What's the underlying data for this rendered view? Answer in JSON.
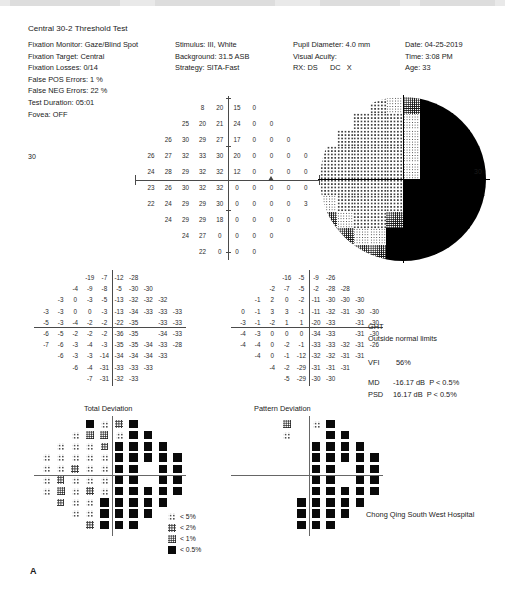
{
  "report": {
    "title": "Central 30-2 Threshold Test",
    "footer_mark": "A",
    "hospital": "Chong Qing South West Hospital"
  },
  "header": {
    "col1": [
      {
        "label": "Fixation Monitor:",
        "value": "Gaze/Blind Spot"
      },
      {
        "label": "Fixation Target:",
        "value": "Central"
      },
      {
        "label": "Fixation Losses:",
        "value": "0/14"
      },
      {
        "label": "False POS Errors:",
        "value": "1 %"
      },
      {
        "label": "False NEG Errors:",
        "value": "22 %"
      },
      {
        "label": "Test Duration:",
        "value": "05:01"
      },
      {
        "label": "Fovea:",
        "value": "OFF"
      }
    ],
    "col2": [
      {
        "label": "Stimulus:",
        "value": "III, White"
      },
      {
        "label": "Background:",
        "value": "31.5 ASB"
      },
      {
        "label": "Strategy:",
        "value": "SITA-Fast"
      }
    ],
    "col3": [
      {
        "label": "Pupil Diameter:",
        "value": "4.0 mm"
      },
      {
        "label": "Visual Acuity:",
        "value": ""
      },
      {
        "label": "RX:",
        "value": "DS      DC   X"
      }
    ],
    "col4": [
      {
        "label": "Date:",
        "value": "04-25-2019"
      },
      {
        "label": "Time:",
        "value": "3:08 PM"
      },
      {
        "label": "Age:",
        "value": "33"
      }
    ]
  },
  "indices": {
    "ght_label": "GHT",
    "ght_value": "Outside normal limits",
    "vfi_label": "VFI",
    "vfi_value": "56%",
    "md_label": "MD",
    "md_value": "-16.17 dB  P < 0.5%",
    "psd_label": "PSD",
    "psd_value": "16.17 dB  P < 0.5%"
  },
  "sections": {
    "total_deviation": "Total Deviation",
    "pattern_deviation": "Pattern Deviation",
    "axis_label_30": "30"
  },
  "legend": {
    "items": [
      {
        "sym": "s-5",
        "label": "< 5%"
      },
      {
        "sym": "s-2",
        "label": "< 2%"
      },
      {
        "sym": "s-1",
        "label": "< 1%"
      },
      {
        "sym": "s-05",
        "label": "< 0.5%"
      }
    ]
  },
  "chart_data": {
    "type": "heatmap",
    "xlabel": "",
    "ylabel": "",
    "units": "dB",
    "grid_pattern": "30-2 (76 test locations, 6° spacing)",
    "threshold_values": {
      "name": "Threshold (dB) sensitivity grid",
      "rows": [
        {
          "cols": [
            null,
            null,
            null,
            "8",
            "20",
            "15",
            "0",
            null,
            null,
            null
          ]
        },
        {
          "cols": [
            null,
            null,
            "25",
            "20",
            "21",
            "24",
            "0",
            "0",
            null,
            null
          ]
        },
        {
          "cols": [
            null,
            "26",
            "30",
            "29",
            "27",
            "17",
            "0",
            "0",
            "0",
            null
          ]
        },
        {
          "cols": [
            "26",
            "27",
            "32",
            "33",
            "30",
            "20",
            "0",
            "0",
            "0",
            "0"
          ]
        },
        {
          "cols": [
            "24",
            "28",
            "29",
            "32",
            "32",
            "12",
            "0",
            "0",
            "0",
            "0"
          ]
        },
        {
          "cols": [
            "23",
            "26",
            "30",
            "32",
            "32",
            "0",
            "0",
            "0",
            "0",
            "0"
          ]
        },
        {
          "cols": [
            "22",
            "24",
            "29",
            "29",
            "30",
            "0",
            "0",
            "0",
            "0",
            "3"
          ]
        },
        {
          "cols": [
            null,
            "24",
            "29",
            "29",
            "18",
            "0",
            "0",
            "0",
            "0",
            null
          ]
        },
        {
          "cols": [
            null,
            null,
            "24",
            "27",
            "0",
            "0",
            "0",
            "0",
            null,
            null
          ]
        },
        {
          "cols": [
            null,
            null,
            null,
            "22",
            "0",
            "0",
            "0",
            null,
            null,
            null
          ]
        }
      ]
    },
    "total_deviation_values": {
      "name": "Total Deviation (dB)",
      "rows": [
        {
          "cols": [
            null,
            null,
            null,
            "-19",
            "-7",
            "-12",
            "-28",
            null,
            null,
            null
          ]
        },
        {
          "cols": [
            null,
            null,
            "-4",
            "-9",
            "-8",
            "-5",
            "-30",
            "-30",
            null,
            null
          ]
        },
        {
          "cols": [
            null,
            "-3",
            "0",
            "-3",
            "-5",
            "-13",
            "-32",
            "-32",
            "-32",
            null
          ]
        },
        {
          "cols": [
            "-3",
            "-3",
            "0",
            "0",
            "-3",
            "-13",
            "-34",
            "-33",
            "-33",
            "-33"
          ]
        },
        {
          "cols": [
            "-5",
            "-3",
            "-4",
            "-2",
            "-2",
            "-22",
            "-35",
            "",
            "-33",
            "-33"
          ]
        },
        {
          "cols": [
            "-6",
            "-5",
            "-2",
            "-2",
            "-2",
            "-36",
            "-35",
            "",
            "-34",
            "-33"
          ]
        },
        {
          "cols": [
            "-7",
            "-6",
            "-3",
            "-4",
            "-3",
            "-35",
            "-35",
            "-34",
            "-33",
            "-28"
          ]
        },
        {
          "cols": [
            null,
            "-6",
            "-3",
            "-3",
            "-14",
            "-34",
            "-34",
            "-34",
            "-33",
            null
          ]
        },
        {
          "cols": [
            null,
            null,
            "-6",
            "-4",
            "-31",
            "-33",
            "-33",
            "-33",
            null,
            null
          ]
        },
        {
          "cols": [
            null,
            null,
            null,
            "-7",
            "-31",
            "-32",
            "-33",
            null,
            null,
            null
          ]
        }
      ]
    },
    "pattern_deviation_values": {
      "name": "Pattern Deviation (dB)",
      "rows": [
        {
          "cols": [
            null,
            null,
            null,
            "-16",
            "-5",
            "-9",
            "-26",
            null,
            null,
            null
          ]
        },
        {
          "cols": [
            null,
            null,
            "-2",
            "-7",
            "-5",
            "-2",
            "-28",
            "-28",
            null,
            null
          ]
        },
        {
          "cols": [
            null,
            "-1",
            "2",
            "0",
            "-2",
            "-11",
            "-30",
            "-30",
            "-30",
            null
          ]
        },
        {
          "cols": [
            "0",
            "-1",
            "3",
            "3",
            "-1",
            "-11",
            "-32",
            "-31",
            "-30",
            "-30"
          ]
        },
        {
          "cols": [
            "-3",
            "-1",
            "-2",
            "1",
            "1",
            "-20",
            "-33",
            "",
            "-31",
            "-30"
          ]
        },
        {
          "cols": [
            "-4",
            "-3",
            "0",
            "0",
            "0",
            "-34",
            "-33",
            "",
            "-31",
            "-30"
          ]
        },
        {
          "cols": [
            "-4",
            "-4",
            "0",
            "-2",
            "-1",
            "-33",
            "-33",
            "-32",
            "-31",
            "-26"
          ]
        },
        {
          "cols": [
            null,
            "-4",
            "0",
            "-1",
            "-12",
            "-32",
            "-32",
            "-31",
            "-31",
            null
          ]
        },
        {
          "cols": [
            null,
            null,
            "-4",
            "-2",
            "-29",
            "-31",
            "-31",
            "-31",
            null,
            null
          ]
        },
        {
          "cols": [
            null,
            null,
            null,
            "-5",
            "-29",
            "-30",
            "-30",
            null,
            null,
            null
          ]
        }
      ]
    },
    "total_deviation_symbols": {
      "name": "Total Deviation probability symbols",
      "legend_order": [
        "blank",
        "s-5",
        "s-2",
        "s-1",
        "s-05"
      ],
      "rows": [
        {
          "cols": [
            null,
            null,
            null,
            "s-05",
            "s-5",
            "s-2",
            "s-05",
            null,
            null,
            null
          ]
        },
        {
          "cols": [
            null,
            null,
            "s-5",
            "s-1",
            "s-1",
            "s-5",
            "s-05",
            "s-05",
            null,
            null
          ]
        },
        {
          "cols": [
            null,
            "s-5",
            "s-5",
            "s-5",
            "s-2",
            "s-05",
            "s-05",
            "s-05",
            "s-05",
            null
          ]
        },
        {
          "cols": [
            "s-5",
            "s-5",
            "s-5",
            "s-5",
            "s-5",
            "s-05",
            "s-05",
            "s-05",
            "s-05",
            "s-05"
          ]
        },
        {
          "cols": [
            "s-5",
            "s-5",
            "s-2",
            "s-5",
            "s-5",
            "s-05",
            "s-05",
            "blank",
            "s-05",
            "s-05"
          ]
        },
        {
          "cols": [
            "s-5",
            "s-2",
            "s-5",
            "s-5",
            "s-5",
            "s-05",
            "s-05",
            "blank",
            "s-05",
            "s-05"
          ]
        },
        {
          "cols": [
            "s-5",
            "s-1",
            "s-5",
            "s-2",
            "s-5",
            "s-05",
            "s-05",
            "s-05",
            "s-05",
            "s-05"
          ]
        },
        {
          "cols": [
            null,
            "s-2",
            "s-5",
            "s-5",
            "s-05",
            "s-05",
            "s-05",
            "s-05",
            "s-05",
            null
          ]
        },
        {
          "cols": [
            null,
            null,
            "s-5",
            "s-5",
            "s-05",
            "s-05",
            "s-05",
            "s-05",
            null,
            null
          ]
        },
        {
          "cols": [
            null,
            null,
            null,
            "s-2",
            "s-05",
            "s-05",
            "s-05",
            null,
            null,
            null
          ]
        }
      ]
    },
    "pattern_deviation_symbols": {
      "name": "Pattern Deviation probability symbols",
      "legend_order": [
        "blank",
        "s-5",
        "s-2",
        "s-1",
        "s-05"
      ],
      "rows": [
        {
          "cols": [
            null,
            null,
            null,
            "s-1",
            "blank",
            "s-5",
            "s-05",
            null,
            null,
            null
          ]
        },
        {
          "cols": [
            null,
            null,
            "blank",
            "s-5",
            "blank",
            "blank",
            "s-05",
            "s-05",
            null,
            null
          ]
        },
        {
          "cols": [
            null,
            "blank",
            "blank",
            "blank",
            "blank",
            "s-05",
            "s-05",
            "s-05",
            "s-05",
            null
          ]
        },
        {
          "cols": [
            "blank",
            "blank",
            "blank",
            "blank",
            "blank",
            "s-05",
            "s-05",
            "s-05",
            "s-05",
            "s-05"
          ]
        },
        {
          "cols": [
            "blank",
            "blank",
            "blank",
            "blank",
            "blank",
            "s-05",
            "s-05",
            "blank",
            "s-05",
            "s-05"
          ]
        },
        {
          "cols": [
            "blank",
            "blank",
            "blank",
            "blank",
            "blank",
            "s-05",
            "s-05",
            "blank",
            "s-05",
            "s-05"
          ]
        },
        {
          "cols": [
            "blank",
            "blank",
            "blank",
            "blank",
            "blank",
            "s-05",
            "s-05",
            "s-05",
            "s-05",
            "s-05"
          ]
        },
        {
          "cols": [
            null,
            "blank",
            "blank",
            "blank",
            "s-05",
            "s-05",
            "s-05",
            "s-05",
            "s-05",
            null
          ]
        },
        {
          "cols": [
            null,
            null,
            "blank",
            "blank",
            "s-05",
            "s-05",
            "s-05",
            "s-05",
            null,
            null
          ]
        },
        {
          "cols": [
            null,
            null,
            null,
            "blank",
            "s-05",
            "s-05",
            "s-05",
            null,
            null,
            null
          ]
        }
      ]
    },
    "greyscale_map": {
      "name": "Greyscale sensitivity map",
      "shades": [
        "gs-w",
        "gs-l",
        "gs-m",
        "gs-d",
        "gs-b"
      ],
      "rows": [
        {
          "cols": [
            "gs-w",
            "gs-w",
            "gs-w",
            "gs-l",
            "gs-m",
            "gs-d",
            "gs-b",
            "gs-b",
            "gs-b",
            "gs-b"
          ]
        },
        {
          "cols": [
            "gs-w",
            "gs-w",
            "gs-l",
            "gs-l",
            "gs-l",
            "gs-m",
            "gs-b",
            "gs-b",
            "gs-b",
            "gs-b"
          ]
        },
        {
          "cols": [
            "gs-w",
            "gs-l",
            "gs-l",
            "gs-l",
            "gs-l",
            "gs-m",
            "gs-b",
            "gs-b",
            "gs-b",
            "gs-b"
          ]
        },
        {
          "cols": [
            "gs-l",
            "gs-l",
            "gs-l",
            "gs-l",
            "gs-l",
            "gs-m",
            "gs-b",
            "gs-b",
            "gs-b",
            "gs-b"
          ]
        },
        {
          "cols": [
            "gs-l",
            "gs-l",
            "gs-l",
            "gs-l",
            "gs-l",
            "gs-m",
            "gs-b",
            "gs-b",
            "gs-b",
            "gs-b"
          ]
        },
        {
          "cols": [
            "gs-l",
            "gs-l",
            "gs-l",
            "gs-l",
            "gs-l",
            "gs-b",
            "gs-b",
            "gs-b",
            "gs-b",
            "gs-b"
          ]
        },
        {
          "cols": [
            "gs-m",
            "gs-l",
            "gs-l",
            "gs-l",
            "gs-l",
            "gs-b",
            "gs-b",
            "gs-b",
            "gs-b",
            "gs-b"
          ]
        },
        {
          "cols": [
            "gs-d",
            "gs-m",
            "gs-l",
            "gs-l",
            "gs-d",
            "gs-b",
            "gs-b",
            "gs-b",
            "gs-b",
            "gs-b"
          ]
        },
        {
          "cols": [
            "gs-b",
            "gs-d",
            "gs-m",
            "gs-m",
            "gs-b",
            "gs-b",
            "gs-b",
            "gs-b",
            "gs-b",
            "gs-b"
          ]
        },
        {
          "cols": [
            "gs-b",
            "gs-b",
            "gs-d",
            "gs-d",
            "gs-b",
            "gs-b",
            "gs-b",
            "gs-b",
            "gs-b",
            "gs-b"
          ]
        }
      ]
    }
  }
}
